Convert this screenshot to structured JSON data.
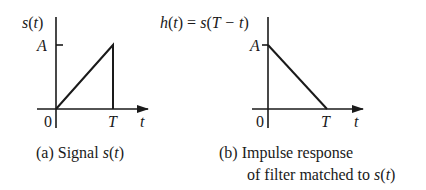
{
  "figure": {
    "panel_a": {
      "y_label_fn": "s",
      "y_label_arg": "t",
      "amplitude_label": "A",
      "origin_label": "0",
      "period_label": "T",
      "x_axis_label": "t",
      "caption_prefix": "(a) Signal ",
      "caption_math_fn": "s",
      "caption_math_arg": "t",
      "shape": "ramp rising from 0 at t=0 to A at t=T, then dropping to 0"
    },
    "panel_b": {
      "y_label_fn": "h",
      "y_label_arg": "t",
      "y_label_eq": " = ",
      "y_label_rhs_fn": "s",
      "y_label_rhs_arg": "T − t",
      "amplitude_label": "A",
      "origin_label": "0",
      "period_label": "T",
      "x_axis_label": "t",
      "caption_line1": "(b) Impulse response",
      "caption_line2_prefix": "of filter matched to ",
      "caption_math_fn": "s",
      "caption_math_arg": "t",
      "shape": "ramp falling from A at t=0 to 0 at t=T"
    },
    "colors": {
      "ink": "#1a1a1a",
      "background": "#ffffff"
    }
  }
}
